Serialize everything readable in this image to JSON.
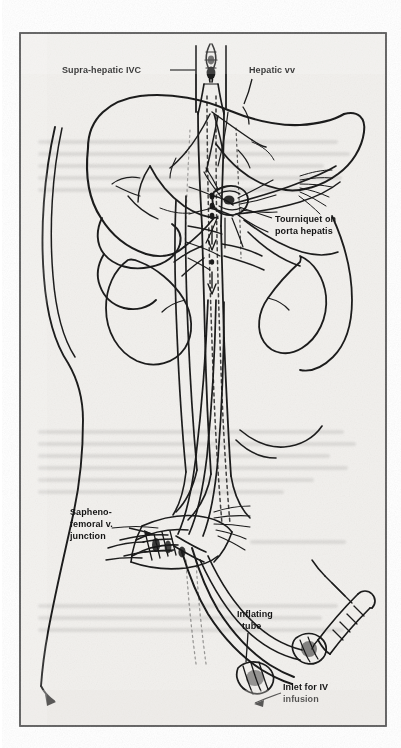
{
  "figure": {
    "medium": "scanned line drawing",
    "background_color": "#f2f0ed",
    "ink_color": "#1a1a1a",
    "frame": {
      "border_color": "#2a2a2a",
      "x": 20,
      "y": 33,
      "width": 366,
      "height": 693
    }
  },
  "labels": [
    {
      "id": "supra-hepatic-ivc",
      "lines": [
        "Supra-hepatic IVC"
      ],
      "text": "Supra-hepatic IVC",
      "x": 62,
      "y": 73,
      "anchor": "start",
      "font_size": 8.5,
      "leader": {
        "from": [
          170,
          70
        ],
        "to": [
          196,
          70
        ]
      }
    },
    {
      "id": "hepatic-vv",
      "lines": [
        "Hepatic vv"
      ],
      "text": "Hepatic vv",
      "x": 249,
      "y": 73,
      "anchor": "start",
      "font_size": 8.5,
      "leader": {
        "from": [
          252,
          79
        ],
        "to": [
          244,
          104
        ]
      }
    },
    {
      "id": "tourniquet-on-porta-hepatis",
      "lines": [
        "Tourniquet on",
        "porta hepatis"
      ],
      "text": "Tourniquet on porta hepatis",
      "x": 275,
      "y": 222,
      "anchor": "start",
      "font_size": 8.5,
      "leader": {
        "from": [
          272,
          219
        ],
        "to": [
          237,
          209
        ]
      }
    },
    {
      "id": "sapheno-femoral-v-junction",
      "lines": [
        "Sapheno-",
        "femoral v.",
        "junction"
      ],
      "text": "Sapheno-femoral v. junction",
      "x": 70,
      "y": 515,
      "anchor": "start",
      "font_size": 8.5,
      "leader": {
        "from": [
          128,
          528
        ],
        "to": [
          152,
          533
        ]
      }
    },
    {
      "id": "inflating-tube",
      "lines": [
        "Inflating",
        "tube"
      ],
      "text": "Inflating tube",
      "x": 237,
      "y": 617,
      "anchor": "start",
      "font_size": 8.5,
      "leader": {
        "from": [
          247,
          630
        ],
        "to": [
          245,
          662
        ]
      }
    },
    {
      "id": "inlet-for-iv-infusion",
      "lines": [
        "Inlet for IV",
        "infusion"
      ],
      "text": "Inlet for IV infusion",
      "x": 283,
      "y": 690,
      "anchor": "start",
      "font_size": 8.5,
      "leader": {
        "from": [
          281,
          693
        ],
        "to": [
          254,
          703
        ]
      }
    }
  ],
  "anatomy": {
    "structures": [
      "liver",
      "gallbladder",
      "right kidney",
      "left kidney",
      "inferior vena cava",
      "aorta",
      "hepatic veins",
      "porta hepatis",
      "renal veins",
      "iliac veins",
      "body wall contour"
    ],
    "devices": [
      "supra-hepatic IVC occlusion balloon catheter",
      "tourniquet on porta hepatis",
      "inflating tube",
      "syringe",
      "IV infusion inlet"
    ]
  }
}
